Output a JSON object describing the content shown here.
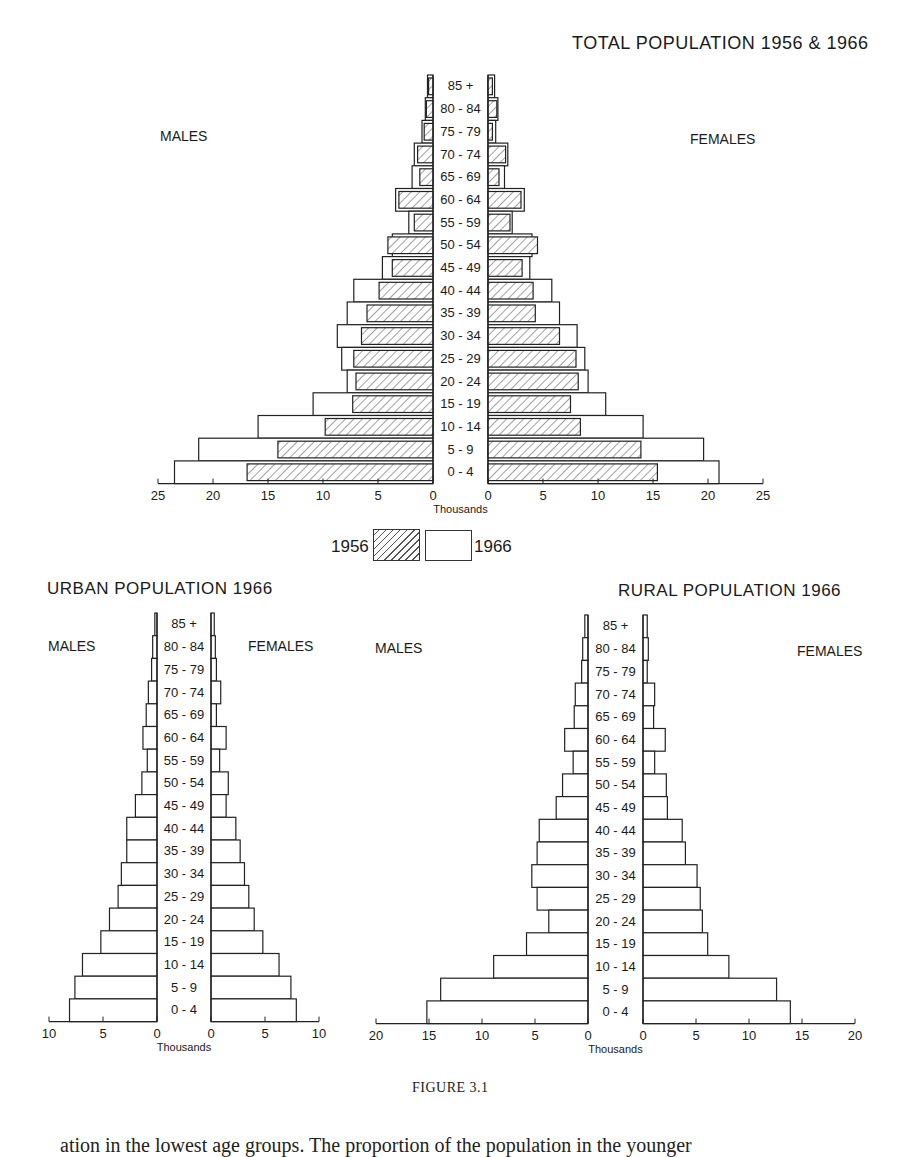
{
  "figure": {
    "caption": "FIGURE 3.1",
    "cut_off_text": "ation in the lowest age groups. The proportion of the population in the younger"
  },
  "legend": {
    "items": [
      {
        "label": "1956",
        "pattern": "hatched"
      },
      {
        "label": "1966",
        "pattern": "open"
      }
    ]
  },
  "chart_data": [
    {
      "id": "total",
      "type": "bar",
      "orientation": "population-pyramid",
      "title": "TOTAL POPULATION 1956 & 1966",
      "left_label": "MALES",
      "right_label": "FEMALES",
      "xlabel": "Thousands",
      "xlim": [
        0,
        25
      ],
      "xticks": [
        0,
        5,
        10,
        15,
        20,
        25
      ],
      "categories": [
        "85 +",
        "80-84",
        "75-79",
        "70-74",
        "65-69",
        "60-64",
        "55-59",
        "50-54",
        "45-49",
        "40-44",
        "35-39",
        "30-34",
        "25-29",
        "20-24",
        "15-19",
        "10-14",
        "5-9",
        "0-4"
      ],
      "series": [
        {
          "name": "Males 1966",
          "side": "left",
          "pattern": "open",
          "values": [
            0.5,
            0.7,
            1.0,
            1.7,
            1.9,
            3.4,
            2.2,
            3.7,
            4.6,
            7.2,
            7.8,
            8.7,
            8.3,
            7.8,
            10.9,
            15.9,
            21.3,
            23.5
          ]
        },
        {
          "name": "Males 1956",
          "side": "left",
          "pattern": "hatched",
          "values": [
            0.4,
            0.6,
            0.8,
            1.4,
            1.2,
            3.1,
            1.7,
            4.1,
            3.7,
            4.9,
            6.0,
            6.5,
            7.2,
            7.0,
            7.3,
            9.8,
            14.1,
            16.9
          ]
        },
        {
          "name": "Females 1966",
          "side": "right",
          "pattern": "open",
          "values": [
            0.6,
            0.9,
            0.7,
            1.8,
            1.5,
            3.3,
            2.2,
            4.0,
            3.8,
            5.8,
            6.5,
            8.1,
            8.8,
            9.1,
            10.7,
            14.1,
            19.6,
            21.0
          ]
        },
        {
          "name": "Females 1956",
          "side": "right",
          "pattern": "hatched",
          "values": [
            0.4,
            0.8,
            0.4,
            1.6,
            1.0,
            3.0,
            2.0,
            4.5,
            3.1,
            4.1,
            4.3,
            6.5,
            8.0,
            8.2,
            7.5,
            8.4,
            13.9,
            15.4
          ]
        }
      ]
    },
    {
      "id": "urban",
      "type": "bar",
      "orientation": "population-pyramid",
      "title": "URBAN POPULATION 1966",
      "left_label": "MALES",
      "right_label": "FEMALES",
      "xlabel": "Thousands",
      "xlim": [
        0,
        10
      ],
      "xticks": [
        0,
        5,
        10
      ],
      "categories": [
        "85 +",
        "80-84",
        "75-79",
        "70-74",
        "65-69",
        "60-64",
        "55-59",
        "50-54",
        "45-49",
        "40-44",
        "35-39",
        "30-34",
        "25-29",
        "20-24",
        "15-19",
        "10-14",
        "5-9",
        "0-4"
      ],
      "series": [
        {
          "name": "Males 1966",
          "side": "left",
          "pattern": "open",
          "values": [
            0.2,
            0.4,
            0.5,
            0.8,
            1.0,
            1.3,
            0.9,
            1.4,
            2.0,
            2.8,
            2.8,
            3.3,
            3.6,
            4.4,
            5.2,
            6.9,
            7.6,
            8.1
          ]
        },
        {
          "name": "Females 1966",
          "side": "right",
          "pattern": "open",
          "values": [
            0.3,
            0.4,
            0.5,
            0.9,
            0.5,
            1.4,
            0.8,
            1.6,
            1.4,
            2.3,
            2.7,
            3.1,
            3.5,
            4.0,
            4.8,
            6.3,
            7.4,
            7.9
          ]
        }
      ]
    },
    {
      "id": "rural",
      "type": "bar",
      "orientation": "population-pyramid",
      "title": "RURAL POPULATION 1966",
      "left_label": "MALES",
      "right_label": "FEMALES",
      "xlabel": "Thousands",
      "xlim": [
        0,
        20
      ],
      "xticks": [
        0,
        5,
        10,
        15,
        20
      ],
      "categories": [
        "85 +",
        "80-84",
        "75-79",
        "70-74",
        "65-69",
        "60-64",
        "55-59",
        "50-54",
        "45-49",
        "40-44",
        "35-39",
        "30-34",
        "25-29",
        "20-24",
        "15-19",
        "10-14",
        "5-9",
        "0-4"
      ],
      "series": [
        {
          "name": "Males 1966",
          "side": "left",
          "pattern": "open",
          "values": [
            0.3,
            0.5,
            0.6,
            1.2,
            1.3,
            2.2,
            1.4,
            2.4,
            3.0,
            4.6,
            4.8,
            5.3,
            4.8,
            3.7,
            5.8,
            8.9,
            13.9,
            15.2
          ]
        },
        {
          "name": "Females 1966",
          "side": "right",
          "pattern": "open",
          "values": [
            0.4,
            0.5,
            0.4,
            1.1,
            1.0,
            2.1,
            1.1,
            2.2,
            2.3,
            3.7,
            4.0,
            5.1,
            5.4,
            5.6,
            6.1,
            8.1,
            12.6,
            13.9
          ]
        }
      ]
    }
  ],
  "layouts": {
    "total": {
      "left_zero": 433,
      "right_zero": 488,
      "px_per_unit": 11.0,
      "top": 75,
      "row_h": 22.7,
      "title_x": 572,
      "title_y": 33,
      "left_label_x": 160,
      "left_label_y": 128,
      "right_label_x": 690,
      "right_label_y": 131,
      "axis_y": 484
    },
    "urban": {
      "left_zero": 157,
      "right_zero": 211,
      "px_per_unit": 10.8,
      "top": 613,
      "row_h": 22.7,
      "title_x": 47,
      "title_y": 581,
      "left_label_x": 48,
      "left_label_y": 638,
      "right_label_x": 248,
      "right_label_y": 638,
      "axis_y": 1022
    },
    "rural": {
      "left_zero": 588,
      "right_zero": 643,
      "px_per_unit": 10.6,
      "top": 615,
      "row_h": 22.7,
      "title_x": 612,
      "title_y": 583,
      "left_label_x": 375,
      "left_label_y": 640,
      "right_label_x": 797,
      "right_label_y": 643,
      "axis_y": 1024
    }
  }
}
